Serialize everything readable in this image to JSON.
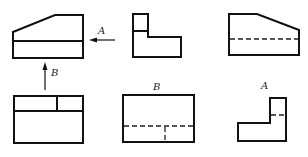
{
  "diagram": {
    "type": "orthographic-projection-views",
    "labels": {
      "arrow_a": "A",
      "arrow_b": "B",
      "view_b_title": "B",
      "view_a_title": "A"
    },
    "colors": {
      "line": "#111111",
      "background": "#ffffff"
    },
    "views": [
      {
        "id": "front-view",
        "row": 1,
        "col": 1,
        "line_styles": [
          "solid"
        ]
      },
      {
        "id": "side-view-l",
        "row": 1,
        "col": 2,
        "line_styles": [
          "solid"
        ]
      },
      {
        "id": "right-view",
        "row": 1,
        "col": 3,
        "line_styles": [
          "solid",
          "dashed"
        ]
      },
      {
        "id": "top-view",
        "row": 2,
        "col": 1,
        "line_styles": [
          "solid"
        ]
      },
      {
        "id": "view-b",
        "row": 2,
        "col": 2,
        "title": "B",
        "line_styles": [
          "solid",
          "dashed"
        ]
      },
      {
        "id": "view-a",
        "row": 2,
        "col": 3,
        "title": "A",
        "line_styles": [
          "solid",
          "dashed"
        ]
      }
    ],
    "arrows": [
      {
        "label": "A",
        "direction": "left"
      },
      {
        "label": "B",
        "direction": "up"
      }
    ]
  }
}
